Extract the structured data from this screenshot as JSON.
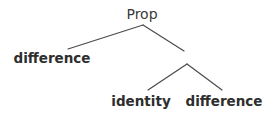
{
  "diagram": {
    "type": "tree",
    "root": {
      "label": "Prop",
      "x": 142,
      "y": 19
    },
    "nodes": [
      {
        "id": "root",
        "label": "Prop",
        "x": 142,
        "y": 19,
        "bold": false
      },
      {
        "id": "leaf1",
        "label": "difference",
        "x": 52,
        "y": 63,
        "bold": true
      },
      {
        "id": "inner",
        "label": "",
        "x": 186,
        "y": 58,
        "bold": false
      },
      {
        "id": "leaf2",
        "label": "identity",
        "x": 141,
        "y": 106,
        "bold": true
      },
      {
        "id": "leaf3",
        "label": "difference",
        "x": 224,
        "y": 106,
        "bold": true
      }
    ],
    "edges": [
      {
        "from": "root",
        "to": "leaf1",
        "x1": 143,
        "y1": 25,
        "x2": 68,
        "y2": 49
      },
      {
        "from": "root",
        "to": "inner",
        "x1": 143,
        "y1": 25,
        "x2": 184,
        "y2": 51
      },
      {
        "from": "inner",
        "to": "leaf2",
        "x1": 187,
        "y1": 64,
        "x2": 148,
        "y2": 90
      },
      {
        "from": "inner",
        "to": "leaf3",
        "x1": 187,
        "y1": 64,
        "x2": 222,
        "y2": 90
      }
    ],
    "labels": {
      "root": "Prop",
      "left_leaf": "difference",
      "inner_left_leaf": "identity",
      "inner_right_leaf": "difference"
    }
  }
}
